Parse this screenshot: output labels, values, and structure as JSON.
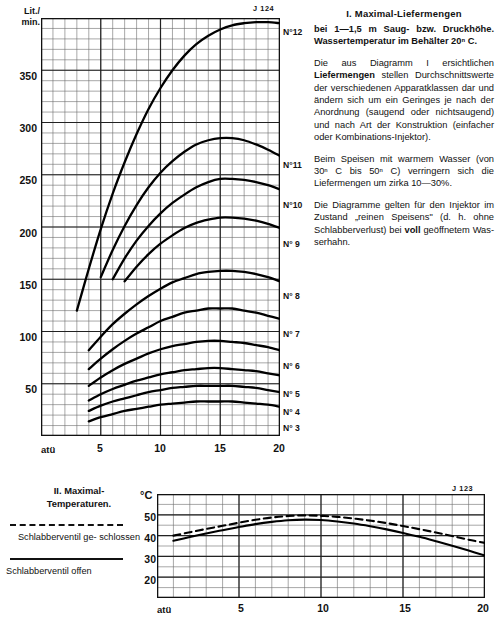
{
  "section_one": {
    "heading": "I. Maximal-Liefermengen",
    "subheading": "bei 1—1,5 m Saug- bzw. Druck­höhe. Wassertemperatur im Be­hälter 20ⁿ C.",
    "paragraphs": [
      {
        "pre": "Die aus Diagramm I ersichtlichen ",
        "bold": "Liefermengen",
        "post": " stellen Durch­schnittswerte der verschiedenen Apparatklassen dar und ändern sich um ein Geringes je nach der Anordnung (saugend oder nichtsaugend) und nach Art der Konstruktion (einfacher oder Kombinations-Injektor)."
      },
      {
        "pre": "Beim Speisen mit warmem Was­ser (von 30ⁿ C bis 50ⁿ C) verrin­gern sich die Liefermengen um zirka 10—30%.",
        "bold": "",
        "post": ""
      },
      {
        "pre": "Die Diagramme gelten für den Injektor im Zustand „reinen Spei­sens\" (d. h. ohne Schlabberver­lust) bei ",
        "bold": "voll",
        "post": " geöffnetem Was­serhahn."
      }
    ]
  },
  "section_two": {
    "heading_line1": "II. Maximal-",
    "heading_line2": "Temperaturen.",
    "legend": [
      {
        "style": "dashed",
        "label": "Schlabberventil ge-\nschlossen"
      },
      {
        "style": "solid",
        "label": "Schlabberventil  offen"
      }
    ]
  },
  "chart_data": [
    {
      "type": "line",
      "id": "diagram-I",
      "title": "I. Maximal-Liefermengen",
      "plate_id": "J 124",
      "xlabel": "atü",
      "ylabel": "Lit./\nmin.",
      "ylabel_line1": "Lit./",
      "ylabel_line2": "min.",
      "xlim": [
        0,
        20
      ],
      "ylim": [
        0,
        400
      ],
      "xticks": [
        5,
        10,
        15,
        20
      ],
      "yticks": [
        50,
        100,
        150,
        200,
        250,
        300,
        350
      ],
      "x_minor_step": 1,
      "y_minor_step": 10,
      "grid": true,
      "series": [
        {
          "name": "N°12",
          "x": [
            3,
            4,
            5,
            6,
            7,
            8,
            9,
            10,
            11,
            12,
            13,
            14,
            15,
            16,
            17,
            18,
            19,
            20
          ],
          "y": [
            120,
            160,
            198,
            232,
            262,
            289,
            313,
            333,
            350,
            364,
            375,
            383,
            389,
            393,
            395,
            396,
            396,
            395
          ]
        },
        {
          "name": "N°11",
          "x": [
            5,
            6,
            7,
            8,
            9,
            10,
            11,
            12,
            13,
            14,
            15,
            16,
            17,
            18,
            19,
            20
          ],
          "y": [
            152,
            178,
            201,
            221,
            238,
            252,
            263,
            272,
            279,
            283,
            285,
            285,
            283,
            279,
            274,
            268
          ]
        },
        {
          "name": "N°10",
          "x": [
            6,
            7,
            8,
            9,
            10,
            11,
            12,
            13,
            14,
            15,
            16,
            17,
            18,
            19,
            20
          ],
          "y": [
            150,
            170,
            187,
            201,
            213,
            223,
            231,
            238,
            243,
            246,
            246,
            245,
            243,
            240,
            236
          ]
        },
        {
          "name": "N° 9",
          "x": [
            7,
            8,
            9,
            10,
            11,
            12,
            13,
            14,
            15,
            16,
            17,
            18,
            19,
            20
          ],
          "y": [
            148,
            162,
            174,
            184,
            192,
            199,
            204,
            207,
            209,
            209,
            208,
            206,
            203,
            199
          ]
        },
        {
          "name": "N° 8",
          "x": [
            4,
            5,
            6,
            7,
            8,
            9,
            10,
            11,
            12,
            13,
            14,
            15,
            16,
            17,
            18,
            19,
            20
          ],
          "y": [
            82,
            95,
            107,
            117,
            126,
            134,
            141,
            147,
            151,
            155,
            157,
            158,
            158,
            157,
            155,
            152,
            148
          ]
        },
        {
          "name": "N° 7",
          "x": [
            4,
            5,
            6,
            7,
            8,
            9,
            10,
            11,
            12,
            13,
            14,
            15,
            16,
            17,
            18,
            19,
            20
          ],
          "y": [
            64,
            74,
            83,
            91,
            98,
            104,
            110,
            114,
            118,
            120,
            122,
            122,
            122,
            120,
            118,
            115,
            112
          ]
        },
        {
          "name": "N° 6",
          "x": [
            4,
            5,
            6,
            7,
            8,
            9,
            10,
            11,
            12,
            13,
            14,
            15,
            16,
            17,
            18,
            19,
            20
          ],
          "y": [
            48,
            56,
            63,
            69,
            74,
            79,
            83,
            86,
            88,
            90,
            91,
            91,
            90,
            89,
            87,
            85,
            82
          ]
        },
        {
          "name": "N° 5",
          "x": [
            4,
            5,
            6,
            7,
            8,
            9,
            10,
            11,
            12,
            13,
            14,
            15,
            16,
            17,
            18,
            19,
            20
          ],
          "y": [
            34,
            40,
            45,
            49,
            53,
            56,
            59,
            61,
            63,
            64,
            65,
            65,
            64,
            63,
            62,
            60,
            58
          ]
        },
        {
          "name": "N° 4",
          "x": [
            4,
            5,
            6,
            7,
            8,
            9,
            10,
            11,
            12,
            13,
            14,
            15,
            16,
            17,
            18,
            19,
            20
          ],
          "y": [
            24,
            29,
            33,
            36,
            39,
            42,
            44,
            46,
            47,
            48,
            48,
            48,
            48,
            47,
            46,
            44,
            42
          ]
        },
        {
          "name": "N° 3",
          "x": [
            4,
            5,
            6,
            7,
            8,
            9,
            10,
            11,
            12,
            13,
            14,
            15,
            16,
            17,
            18,
            19,
            20
          ],
          "y": [
            14,
            18,
            21,
            24,
            26,
            28,
            30,
            31,
            32,
            33,
            33,
            33,
            33,
            32,
            31,
            30,
            28
          ]
        }
      ]
    },
    {
      "type": "line",
      "id": "diagram-II",
      "title": "II. Maximal-Temperaturen.",
      "plate_id": "J 123",
      "xlabel": "atü",
      "ylabel": "°C",
      "xlim": [
        0,
        20
      ],
      "ylim": [
        10,
        60
      ],
      "xticks": [
        5,
        10,
        15,
        20
      ],
      "yticks": [
        20,
        30,
        40,
        50
      ],
      "x_minor_step": 1,
      "y_minor_step": 5,
      "grid": true,
      "series": [
        {
          "name": "Schlabberventil geschlossen",
          "style": "dashed",
          "x": [
            1,
            2,
            3,
            4,
            5,
            6,
            7,
            8,
            9,
            10,
            11,
            12,
            13,
            14,
            15,
            16,
            17,
            18,
            19,
            20
          ],
          "y": [
            40.0,
            41.6,
            43.2,
            44.7,
            46.2,
            47.6,
            48.7,
            49.4,
            49.7,
            49.5,
            49.0,
            48.2,
            47.2,
            46.0,
            44.6,
            43.1,
            41.5,
            39.8,
            38.0,
            36.5
          ]
        },
        {
          "name": "Schlabberventil offen",
          "style": "solid",
          "x": [
            1,
            2,
            3,
            4,
            5,
            6,
            7,
            8,
            9,
            10,
            11,
            12,
            13,
            14,
            15,
            16,
            17,
            18,
            19,
            20
          ],
          "y": [
            37.5,
            39.3,
            41.0,
            42.6,
            44.1,
            45.5,
            46.6,
            47.4,
            47.7,
            47.5,
            46.8,
            45.8,
            44.5,
            43.0,
            41.3,
            39.4,
            37.3,
            35.1,
            32.8,
            30.4
          ]
        }
      ]
    }
  ]
}
